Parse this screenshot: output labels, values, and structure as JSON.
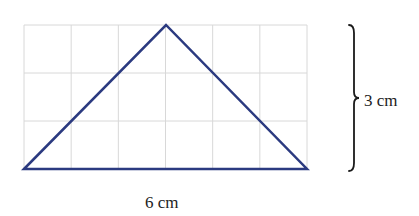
{
  "diagram": {
    "grid": {
      "columns": 6,
      "rows": 3,
      "left": 24,
      "top": 25,
      "right": 307,
      "bottom": 169,
      "line_color": "#d8d8d8"
    },
    "triangle": {
      "vertices": [
        [
          24,
          169
        ],
        [
          166,
          25
        ],
        [
          307,
          169
        ]
      ],
      "stroke_color": "#2b3a80",
      "stroke_width": 2.5
    },
    "labels": {
      "base": "6 cm",
      "height": "3 cm"
    },
    "brace": {
      "x": 352,
      "top": 25,
      "bottom": 171,
      "color": "#1a1a1a"
    }
  }
}
